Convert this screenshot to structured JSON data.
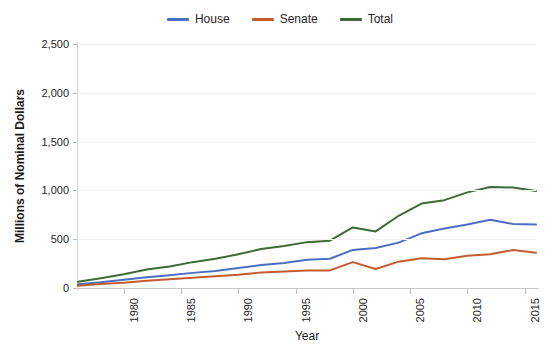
{
  "chart_data": {
    "type": "line",
    "title": "",
    "xlabel": "Year",
    "ylabel": "Millions of Nominal Dollars",
    "xlim": [
      1976,
      2016
    ],
    "ylim": [
      0,
      2500
    ],
    "grid": true,
    "legend_position": "top-center",
    "x_tick_labels": [
      "1980",
      "1985",
      "1990",
      "1995",
      "2000",
      "2005",
      "2010",
      "2015"
    ],
    "x_ticks": [
      1980,
      1985,
      1990,
      1995,
      2000,
      2005,
      2010,
      2015
    ],
    "y_tick_labels": [
      "0",
      "500",
      "1,000",
      "1,500",
      "2,000",
      "2,500"
    ],
    "y_ticks": [
      0,
      500,
      1000,
      1500,
      2000,
      2500
    ],
    "x": [
      1976,
      1978,
      1980,
      1982,
      1984,
      1986,
      1988,
      1990,
      1992,
      1994,
      1996,
      1998,
      2000,
      2002,
      2004,
      2006,
      2008,
      2010,
      2012,
      2014,
      2016
    ],
    "series": [
      {
        "name": "House",
        "color": "#4a6fc0",
        "values": [
          38,
          60,
          85,
          110,
          130,
          155,
          175,
          205,
          235,
          255,
          290,
          300,
          390,
          410,
          465,
          560,
          610,
          650,
          700,
          655,
          650
        ]
      },
      {
        "name": "Senate",
        "color": "#c35b2d",
        "values": [
          24,
          40,
          55,
          75,
          90,
          105,
          120,
          135,
          160,
          170,
          180,
          180,
          265,
          195,
          270,
          305,
          295,
          330,
          345,
          390,
          360
        ]
      },
      {
        "name": "Total",
        "color": "#3c6b34",
        "values": [
          64,
          100,
          140,
          190,
          220,
          265,
          300,
          345,
          400,
          430,
          470,
          485,
          620,
          580,
          740,
          865,
          900,
          980,
          1035,
          1030,
          995
        ]
      }
    ]
  },
  "legend": {
    "items": [
      {
        "label": "House",
        "color": "#4a6fc0"
      },
      {
        "label": "Senate",
        "color": "#c35b2d"
      },
      {
        "label": "Total",
        "color": "#3c6b34"
      }
    ]
  },
  "axes": {
    "x_title": "Year",
    "y_title": "Millions of Nominal Dollars"
  }
}
